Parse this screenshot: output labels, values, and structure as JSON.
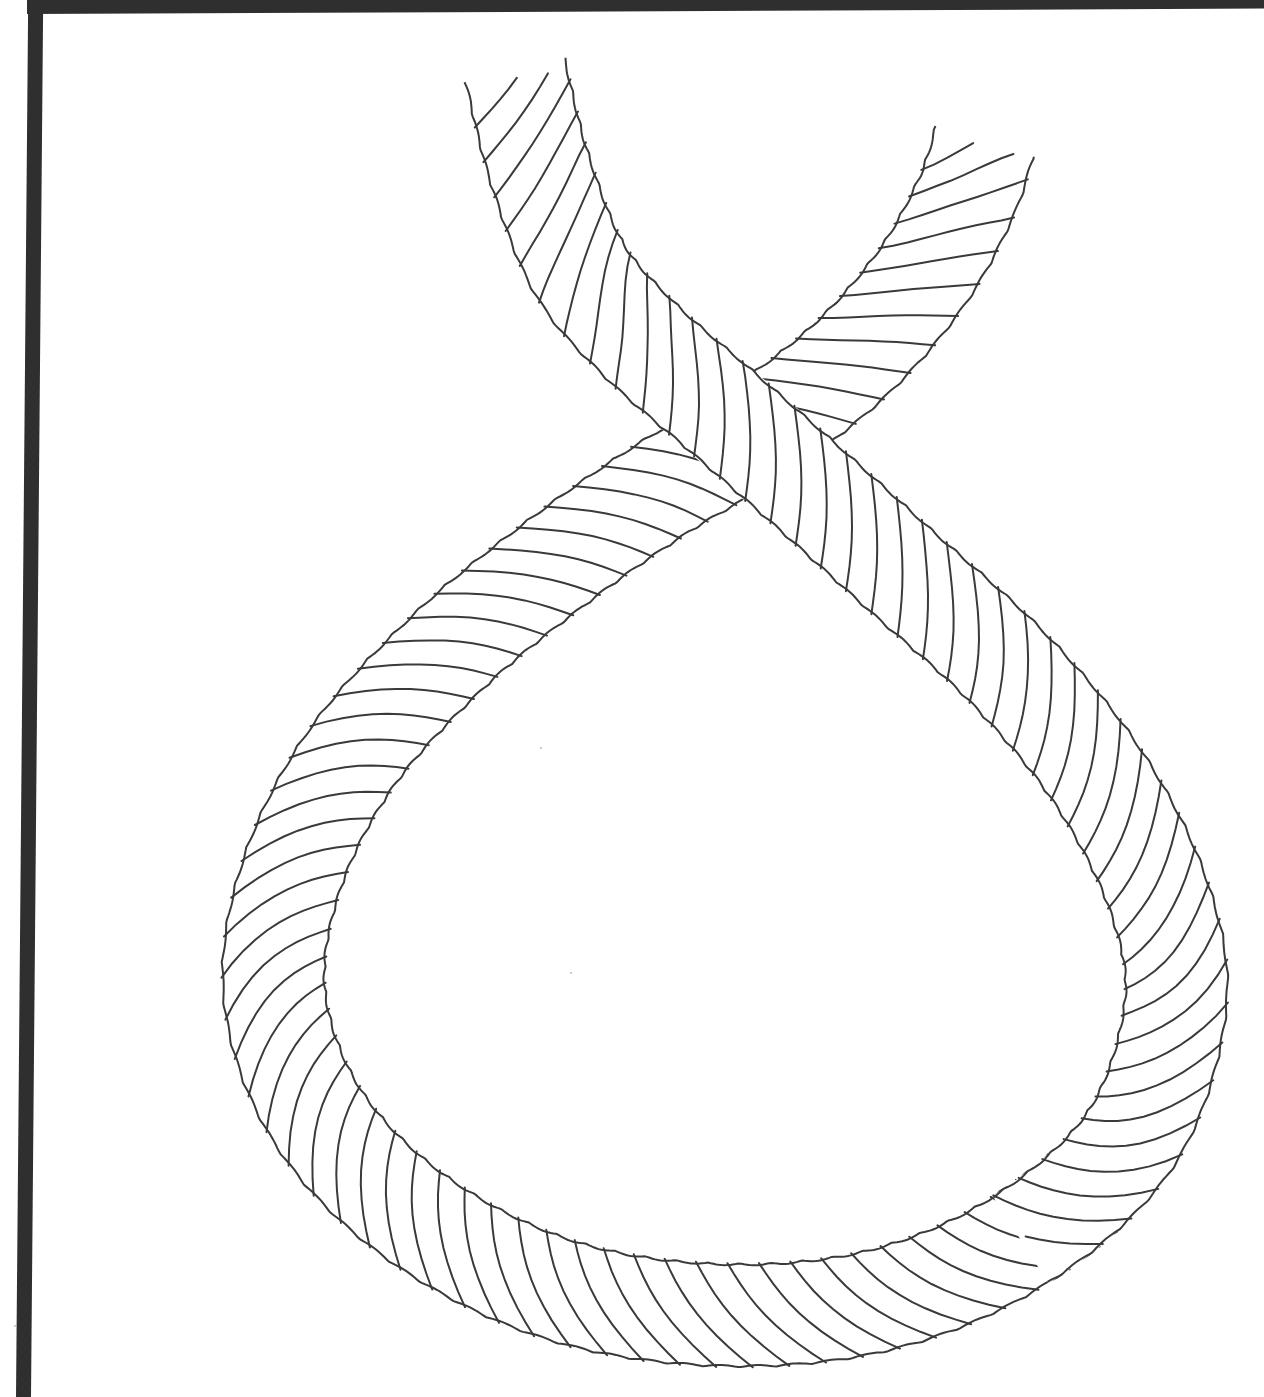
{
  "illustration": {
    "subject": "Twisted rope tied in a single loop crossing (coloring page line art)",
    "line_color": "#3a3a3a",
    "background_color": "#ffffff",
    "frame_color": "#2f2f2f",
    "rope_width": 104,
    "strand_spacing": 34,
    "centerline": [
      [
        515,
        70
      ],
      [
        540,
        170
      ],
      [
        580,
        270
      ],
      [
        640,
        340
      ],
      [
        720,
        410
      ],
      [
        800,
        480
      ],
      [
        900,
        570
      ],
      [
        1010,
        670
      ],
      [
        1100,
        780
      ],
      [
        1160,
        900
      ],
      [
        1175,
        1010
      ],
      [
        1130,
        1140
      ],
      [
        1020,
        1240
      ],
      [
        880,
        1300
      ],
      [
        720,
        1315
      ],
      [
        560,
        1290
      ],
      [
        420,
        1220
      ],
      [
        320,
        1120
      ],
      [
        275,
        1000
      ],
      [
        290,
        880
      ],
      [
        350,
        760
      ],
      [
        450,
        650
      ],
      [
        560,
        560
      ],
      [
        660,
        490
      ],
      [
        760,
        430
      ],
      [
        850,
        360
      ],
      [
        920,
        280
      ],
      [
        965,
        200
      ],
      [
        985,
        140
      ]
    ],
    "specks": [
      [
        540,
        747
      ],
      [
        570,
        972
      ],
      [
        14,
        1325
      ]
    ]
  }
}
